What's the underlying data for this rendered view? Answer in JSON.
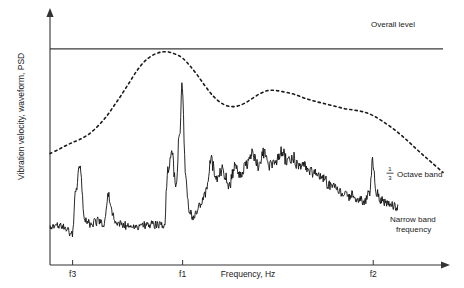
{
  "chart_data": {
    "type": "line",
    "title": "",
    "subtitle": "",
    "xlabel": "Frequency, Hz",
    "ylabel": "Vibration velocity, waveform, PSD",
    "grid": false,
    "legend_position": "inline-annotations",
    "xlim": [
      0,
      1
    ],
    "ylim": [
      0,
      1
    ],
    "x_tick_labels": [
      "f3",
      "f1",
      "f2"
    ],
    "x_tick_positions": [
      0.0575,
      0.3375,
      0.8225
    ],
    "annotations": [
      {
        "name": "overall-level",
        "text": "Overall level",
        "x": 0.93,
        "y": 0.885
      },
      {
        "name": "third-octave-band",
        "text": "Octave band",
        "prefix_fraction": "1/3",
        "x": 0.915,
        "y": 0.395
      },
      {
        "name": "narrow-band-frequency",
        "text_line1": "Narrow band",
        "text_line2": "frequency",
        "x": 0.915,
        "y": 0.21
      }
    ],
    "series": [
      {
        "name": "Overall level",
        "style": "solid-horizontal",
        "color": "#333333",
        "level": 0.882,
        "x_start": 0.0,
        "x_end": 1.0
      },
      {
        "name": "1/3 Octave band",
        "style": "dashed",
        "color": "#1a1a1a",
        "x": [
          0.0,
          0.02,
          0.04,
          0.057,
          0.075,
          0.095,
          0.115,
          0.135,
          0.15,
          0.165,
          0.18,
          0.2,
          0.22,
          0.24,
          0.26,
          0.28,
          0.3,
          0.32,
          0.337,
          0.355,
          0.375,
          0.395,
          0.415,
          0.435,
          0.455,
          0.475,
          0.495,
          0.515,
          0.535,
          0.555,
          0.575,
          0.6,
          0.625,
          0.65,
          0.675,
          0.7,
          0.725,
          0.75,
          0.775,
          0.8,
          0.822,
          0.845,
          0.87,
          0.895,
          0.92,
          0.945,
          0.97,
          1.0
        ],
        "y": [
          0.455,
          0.47,
          0.487,
          0.5,
          0.512,
          0.53,
          0.556,
          0.59,
          0.62,
          0.655,
          0.69,
          0.74,
          0.79,
          0.83,
          0.855,
          0.868,
          0.87,
          0.86,
          0.845,
          0.815,
          0.775,
          0.73,
          0.69,
          0.662,
          0.648,
          0.648,
          0.66,
          0.68,
          0.7,
          0.712,
          0.712,
          0.705,
          0.695,
          0.68,
          0.668,
          0.658,
          0.648,
          0.638,
          0.632,
          0.624,
          0.61,
          0.588,
          0.56,
          0.528,
          0.492,
          0.455,
          0.42,
          0.378
        ]
      },
      {
        "name": "Narrow band frequency",
        "style": "solid-noisy",
        "color": "#111111",
        "baseline_x": [
          0.0,
          0.03,
          0.045,
          0.05,
          0.057,
          0.065,
          0.075,
          0.09,
          0.105,
          0.12,
          0.135,
          0.15,
          0.16,
          0.17,
          0.185,
          0.2,
          0.215,
          0.23,
          0.245,
          0.26,
          0.275,
          0.29,
          0.3,
          0.31,
          0.32,
          0.33,
          0.337,
          0.345,
          0.355,
          0.365,
          0.38,
          0.395,
          0.41,
          0.425,
          0.44,
          0.455,
          0.47,
          0.485,
          0.5,
          0.515,
          0.53,
          0.545,
          0.56,
          0.575,
          0.59,
          0.605,
          0.62,
          0.635,
          0.65,
          0.665,
          0.68,
          0.695,
          0.71,
          0.725,
          0.74,
          0.755,
          0.77,
          0.785,
          0.8,
          0.812,
          0.822,
          0.832,
          0.845,
          0.86,
          0.875,
          0.89,
          0.905,
          0.92,
          0.935,
          0.95,
          0.965,
          0.98
        ],
        "baseline_y": [
          0.155,
          0.16,
          0.15,
          0.135,
          0.145,
          0.3,
          0.42,
          0.18,
          0.172,
          0.178,
          0.17,
          0.29,
          0.2,
          0.175,
          0.165,
          0.16,
          0.158,
          0.162,
          0.16,
          0.168,
          0.165,
          0.17,
          0.395,
          0.48,
          0.34,
          0.56,
          0.76,
          0.38,
          0.215,
          0.2,
          0.235,
          0.3,
          0.43,
          0.36,
          0.395,
          0.33,
          0.4,
          0.37,
          0.42,
          0.455,
          0.4,
          0.465,
          0.41,
          0.43,
          0.47,
          0.415,
          0.435,
          0.405,
          0.4,
          0.382,
          0.368,
          0.35,
          0.33,
          0.315,
          0.3,
          0.292,
          0.28,
          0.268,
          0.255,
          0.3,
          0.43,
          0.29,
          0.262,
          0.255,
          0.248,
          0.24,
          0.23,
          0.222,
          0.215,
          0.205,
          0.196,
          0.185
        ],
        "noise_amplitude": 0.022,
        "x_start": 0.0,
        "x_end": 0.885
      }
    ]
  },
  "axes": {
    "y_axis": {
      "name": "y-axis",
      "has_arrow": true
    },
    "x_axis": {
      "name": "x-axis",
      "has_arrow": true
    }
  }
}
